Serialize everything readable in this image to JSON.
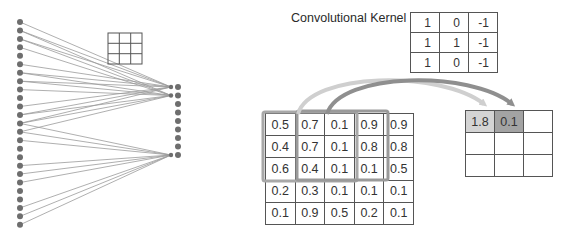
{
  "network": {
    "input_nodes": 25,
    "output_nodes": 9,
    "connections": [
      {
        "target": 0,
        "sources": [
          0,
          1,
          2,
          5,
          6,
          7,
          10,
          11,
          12
        ]
      },
      {
        "target": 1,
        "sources": [
          1,
          2,
          3,
          6,
          7,
          8,
          11,
          12,
          13
        ]
      },
      {
        "target": 8,
        "sources": [
          12,
          13,
          14,
          17,
          18,
          19,
          22,
          23,
          24
        ]
      }
    ],
    "small_grid": {
      "rows": 3,
      "cols": 3
    }
  },
  "kernel": {
    "label": "Convolutional Kernel",
    "rows": [
      [
        "1",
        "0",
        "-1"
      ],
      [
        "1",
        "1",
        "-1"
      ],
      [
        "1",
        "0",
        "-1"
      ]
    ]
  },
  "input": {
    "rows": [
      [
        "0.5",
        "0.7",
        "0.1",
        "0.9",
        "0.9"
      ],
      [
        "0.4",
        "0.7",
        "0.1",
        "0.8",
        "0.8"
      ],
      [
        "0.6",
        "0.4",
        "0.1",
        "0.1",
        "0.5"
      ],
      [
        "0.2",
        "0.3",
        "0.1",
        "0.1",
        "0.1"
      ],
      [
        "0.1",
        "0.9",
        "0.5",
        "0.2",
        "0.1"
      ]
    ]
  },
  "output": {
    "rows": [
      [
        "1.8",
        "0.1",
        ""
      ],
      [
        "",
        "",
        ""
      ],
      [
        "",
        "",
        ""
      ]
    ],
    "highlight_colors": [
      "#d4d4d4",
      "#a3a3a3"
    ]
  },
  "colors": {
    "node": "#6e6e6e",
    "edge": "#9a9a9a",
    "window": "#9e9e9e",
    "arrow_light": "#cfcfcf",
    "arrow_dark": "#8f8f8f"
  }
}
